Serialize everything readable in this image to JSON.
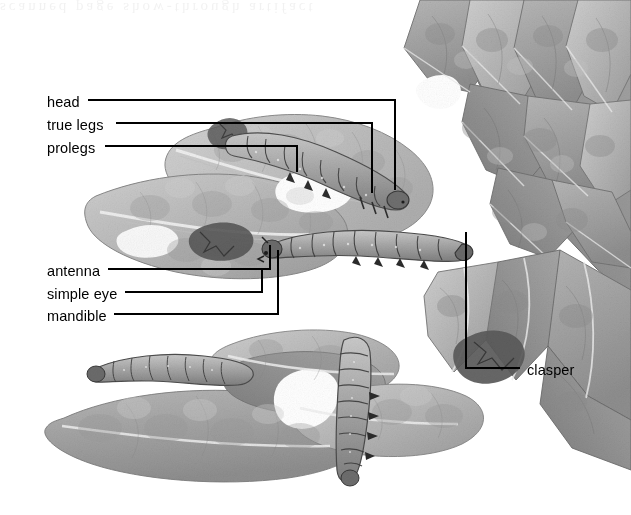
{
  "figure": {
    "type": "labeled-scientific-illustration",
    "style": "grayscale halftone textbook plate",
    "background_color": "#ffffff",
    "ink_color": "#000000",
    "ghost_text": "scanned page show-through artifact"
  },
  "labels": [
    {
      "id": "head",
      "text": "head",
      "text_x": 47,
      "text_y": 103,
      "side": "left"
    },
    {
      "id": "true-legs",
      "text": "true legs",
      "text_x": 47,
      "text_y": 126,
      "side": "left"
    },
    {
      "id": "prolegs",
      "text": "prolegs",
      "text_x": 47,
      "text_y": 149,
      "side": "left"
    },
    {
      "id": "antenna",
      "text": "antenna",
      "text_x": 47,
      "text_y": 272,
      "side": "left"
    },
    {
      "id": "simple-eye",
      "text": "simple eye",
      "text_x": 47,
      "text_y": 295,
      "side": "left"
    },
    {
      "id": "mandible",
      "text": "mandible",
      "text_x": 47,
      "text_y": 317,
      "side": "left"
    },
    {
      "id": "clasper",
      "text": "clasper",
      "text_x": 527,
      "text_y": 371,
      "side": "right"
    }
  ],
  "leaders": [
    {
      "id": "head",
      "points": "88,100 395,100 395,190"
    },
    {
      "id": "true-legs",
      "points": "116,123 372,123 372,193"
    },
    {
      "id": "prolegs",
      "points": "105,146 297,146 297,172"
    },
    {
      "id": "antenna",
      "points": "108,269 270,269 270,245"
    },
    {
      "id": "simple-eye",
      "points": "125,292 262,292 262,268"
    },
    {
      "id": "mandible",
      "points": "114,314 278,314 278,250"
    },
    {
      "id": "clasper",
      "points": "520,368 466,368 466,232"
    }
  ],
  "leaf_tone_palette": {
    "paper": "#ffffff",
    "pale": "#d9d9d9",
    "light": "#c2c2c2",
    "mid": "#ababab",
    "medium": "#999999",
    "dark": "#888888",
    "darker": "#757575",
    "shadow": "#5e5e5e",
    "vein": "#efefef",
    "outline": "#4a4a4a"
  },
  "caterpillars": [
    {
      "id": "caterpillar-upper",
      "description": "large caterpillar on upper leaf lobe, head at right, segments visible"
    },
    {
      "id": "caterpillar-middle",
      "description": "caterpillar across centre of plate, head at left, clasper at right"
    },
    {
      "id": "caterpillar-lower-left",
      "description": "caterpillar on lower-left lobe margin"
    },
    {
      "id": "caterpillar-bottom",
      "description": "caterpillar oriented vertically on bottom-centre lobe"
    }
  ]
}
